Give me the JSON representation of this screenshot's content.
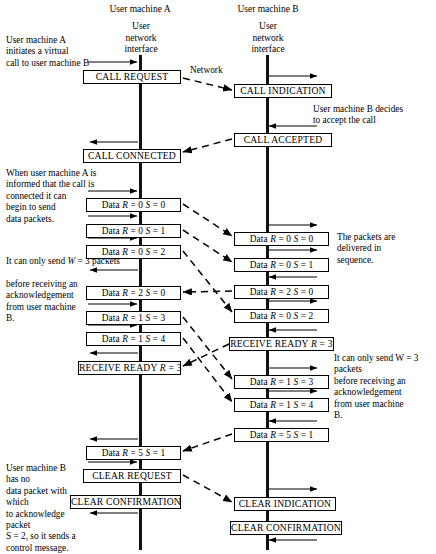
{
  "diagram": {
    "type": "sequence",
    "size": {
      "width": 436,
      "height": 554
    },
    "lifelines": [
      {
        "name": "User machine A",
        "label": "User machine A",
        "interface_label": "User\nnetwork\ninterface",
        "x": 140
      },
      {
        "name": "User machine B",
        "label": "User machine B",
        "interface_label": "User\nnetwork\ninterface",
        "x": 267
      }
    ],
    "network_label": "Network",
    "notes": [
      {
        "id": "note-a-initiate",
        "text": "User machine A\ninitiates a virtual\ncall to user machine B"
      },
      {
        "id": "note-b-accept",
        "text": "User machine B decides\nto accept the call"
      },
      {
        "id": "note-a-connected",
        "text": "When user machine A is\ninformed that the call is\nconnected it can\nbegin to send\ndata packets."
      },
      {
        "id": "note-b-sequence",
        "text": "The packets are\ndelivered in\nsequence."
      },
      {
        "id": "note-window",
        "text": "It can only send W = 3 packets\nbefore receiving an\nacknowledgement\nfrom user machine\nB."
      },
      {
        "id": "note-window-plain-1",
        "text": "It can only send "
      },
      {
        "id": "note-window-ital",
        "text": "W"
      },
      {
        "id": "note-window-plain-2",
        "text": " = 3 packets"
      },
      {
        "id": "note-b-control",
        "text": "User machine B has no\ndata packet with which\nto acknowledge packet\nS = 2, so it sends a\ncontrol message."
      },
      {
        "id": "note-a-clearing",
        "text": "User machine A\ninitates the\nclearing of\nthe virtual\ncall."
      }
    ],
    "left_packets": [
      {
        "id": "call-request",
        "text": "CALL REQUEST",
        "caps": true,
        "y": 70,
        "x": 83,
        "w": 98
      },
      {
        "id": "call-connected",
        "text": "CALL CONNECTED",
        "caps": true,
        "y": 149,
        "x": 83,
        "w": 98
      },
      {
        "id": "data-r0-s0-a",
        "text": "Data R = 0 S = 0",
        "caps": false,
        "y": 198,
        "x": 86,
        "w": 95
      },
      {
        "id": "data-r0-s1-a",
        "text": "Data R = 0 S = 1",
        "caps": false,
        "y": 224,
        "x": 86,
        "w": 95
      },
      {
        "id": "data-r0-s2-a",
        "text": "Data R = 0 S = 2",
        "caps": false,
        "y": 245,
        "x": 86,
        "w": 95
      },
      {
        "id": "data-r2-s0-a",
        "text": "Data R = 2 S = 0",
        "caps": false,
        "y": 286,
        "x": 86,
        "w": 95
      },
      {
        "id": "data-r1-s3-a",
        "text": "Data R = 1 S = 3",
        "caps": false,
        "y": 311,
        "x": 86,
        "w": 95
      },
      {
        "id": "data-r1-s4-a",
        "text": "Data R = 1 S = 4",
        "caps": false,
        "y": 332,
        "x": 86,
        "w": 95
      },
      {
        "id": "receive-ready-r3-a",
        "text": "RECEIVE READY R = 3",
        "caps": true,
        "y": 361,
        "x": 78,
        "w": 103
      },
      {
        "id": "data-r5-s1-a",
        "text": "Data R = 5 S = 1",
        "caps": false,
        "y": 446,
        "x": 86,
        "w": 95
      },
      {
        "id": "clear-request",
        "text": "CLEAR REQUEST",
        "caps": true,
        "y": 469,
        "x": 83,
        "w": 98
      },
      {
        "id": "clear-confirmation-a",
        "text": "CLEAR CONFIRMATION",
        "caps": true,
        "y": 495,
        "x": 70,
        "w": 111
      }
    ],
    "right_packets": [
      {
        "id": "call-indication",
        "text": "CALL INDICATION",
        "caps": true,
        "y": 84,
        "x": 234,
        "w": 98
      },
      {
        "id": "call-accepted",
        "text": "CALL ACCEPTED",
        "caps": true,
        "y": 133,
        "x": 234,
        "w": 98
      },
      {
        "id": "data-r0-s0-b",
        "text": "Data R = 0 S = 0",
        "caps": false,
        "y": 232,
        "x": 234,
        "w": 95
      },
      {
        "id": "data-r0-s1-b",
        "text": "Data R = 0 S = 1",
        "caps": false,
        "y": 258,
        "x": 234,
        "w": 95
      },
      {
        "id": "data-r2-s0-b",
        "text": "Data R = 2 S = 0",
        "caps": false,
        "y": 285,
        "x": 234,
        "w": 95
      },
      {
        "id": "data-r0-s2-b",
        "text": "Data R = 0 S = 2",
        "caps": false,
        "y": 309,
        "x": 234,
        "w": 95
      },
      {
        "id": "receive-ready-r3-b",
        "text": "RECEIVE READY R = 3",
        "caps": true,
        "y": 337,
        "x": 229,
        "w": 105
      },
      {
        "id": "data-r1-s3-b",
        "text": "Data R = 1 S = 3",
        "caps": false,
        "y": 375,
        "x": 234,
        "w": 95
      },
      {
        "id": "data-r1-s4-b",
        "text": "Data R = 1 S = 4",
        "caps": false,
        "y": 398,
        "x": 234,
        "w": 95
      },
      {
        "id": "data-r5-s1-b",
        "text": "Data R = 5 S = 1",
        "caps": false,
        "y": 428,
        "x": 234,
        "w": 95
      },
      {
        "id": "clear-indication",
        "text": "CLEAR INDICATION",
        "caps": true,
        "y": 497,
        "x": 234,
        "w": 102
      },
      {
        "id": "clear-confirmation-b",
        "text": "CLEAR CONFIRMATION",
        "caps": true,
        "y": 521,
        "x": 230,
        "w": 112
      }
    ],
    "colors": {
      "ink": "#000000",
      "paper": "#ffffff",
      "line": "#111111"
    }
  }
}
